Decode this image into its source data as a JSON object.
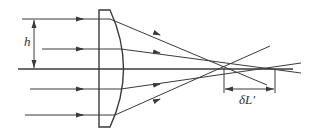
{
  "diagram": {
    "labels": {
      "height": "h",
      "aberration": "δL′"
    },
    "colors": {
      "line": "#3a3a3a",
      "background": "#ffffff"
    },
    "rays": [
      {
        "name": "ray-top-outer",
        "y": 19
      },
      {
        "name": "ray-top-inner",
        "y": 49
      },
      {
        "name": "optical-axis",
        "y": 69
      },
      {
        "name": "ray-bottom-inner",
        "y": 89
      },
      {
        "name": "ray-bottom-outer",
        "y": 115
      }
    ]
  }
}
